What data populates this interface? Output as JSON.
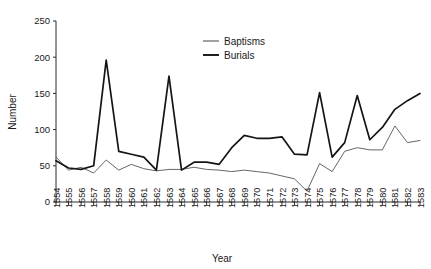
{
  "chart_data": {
    "type": "line",
    "title": "",
    "xlabel": "Year",
    "ylabel": "Number",
    "xlim": [
      1554,
      1583
    ],
    "ylim": [
      0,
      250
    ],
    "yticks": [
      0,
      50,
      100,
      150,
      200,
      250
    ],
    "grid": false,
    "legend_position": "upper-center",
    "categories": [
      "1554",
      "1555",
      "1556",
      "1557",
      "1558",
      "1559",
      "1560",
      "1561",
      "1562",
      "1563",
      "1564",
      "1565",
      "1566",
      "1567",
      "1568",
      "1569",
      "1570",
      "1571",
      "1572",
      "1573",
      "1574",
      "1575",
      "1576",
      "1577",
      "1578",
      "1579",
      "1580",
      "1581",
      "1582",
      "1583"
    ],
    "series": [
      {
        "name": "Baptisms",
        "color": "#555555",
        "values": [
          62,
          44,
          48,
          40,
          58,
          44,
          52,
          46,
          43,
          45,
          45,
          48,
          45,
          44,
          42,
          44,
          42,
          40,
          36,
          32,
          15,
          53,
          42,
          70,
          75,
          72,
          72,
          105,
          82,
          85
        ]
      },
      {
        "name": "Burials",
        "color": "#151515",
        "values": [
          57,
          47,
          45,
          50,
          196,
          70,
          66,
          62,
          44,
          174,
          44,
          55,
          55,
          52,
          75,
          92,
          88,
          88,
          90,
          66,
          65,
          151,
          62,
          82,
          147,
          86,
          103,
          128,
          140,
          150
        ]
      }
    ]
  },
  "legend": {
    "items": [
      {
        "label": "Baptisms"
      },
      {
        "label": "Burials"
      }
    ]
  },
  "axes": {
    "y_title": "Number",
    "x_title": "Year"
  }
}
